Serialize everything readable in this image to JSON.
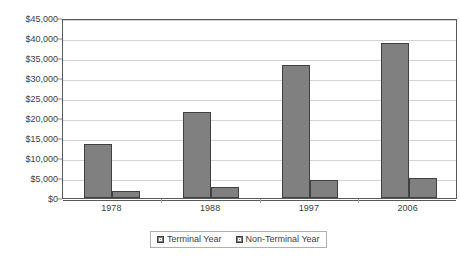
{
  "chart_data": {
    "type": "bar",
    "title": "",
    "xlabel": "",
    "ylabel": "",
    "categories": [
      "1978",
      "1988",
      "1997",
      "2006"
    ],
    "series": [
      {
        "name": "Terminal Year",
        "color": "#808080",
        "values": [
          13400,
          21500,
          33200,
          38700
        ]
      },
      {
        "name": "Non-Terminal Year",
        "color": "#808080",
        "values": [
          1700,
          2800,
          4600,
          5100
        ]
      }
    ],
    "ylim": [
      0,
      45000
    ],
    "ytick_step": 5000,
    "ytick_labels": [
      "$0",
      "$5,000",
      "$10,000",
      "$15,000",
      "$20,000",
      "$25,000",
      "$30,000",
      "$35,000",
      "$40,000",
      "$45,000"
    ],
    "grid": true,
    "legend_position": "bottom"
  },
  "legend": {
    "items": [
      {
        "label": "Terminal Year",
        "swatch": "legend-swatch-icon"
      },
      {
        "label": "Non-Terminal Year",
        "swatch": "legend-swatch-icon"
      }
    ]
  }
}
